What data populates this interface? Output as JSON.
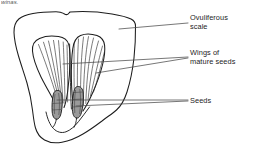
{
  "page": {
    "width": 253,
    "height": 160,
    "background_color": "#ffffff",
    "ink_color": "#1d1d1d",
    "seed_fill_color": "#8e8e8e"
  },
  "caption": {
    "fragment_text": "winas."
  },
  "labels": [
    {
      "id": "ovuliferous-scale",
      "text": "Ovuliferous\nscale",
      "leader_from": [
        188,
        23
      ],
      "leader_to": [
        119,
        29
      ]
    },
    {
      "id": "wings-of-mature-seeds",
      "text": "Wings of\nmature seeds",
      "leader_from": [
        188,
        57
      ],
      "leader_to": [
        63,
        64
      ]
    },
    {
      "id": "seeds",
      "text": "Seeds",
      "leader_from": [
        188,
        100
      ],
      "leader_to": [
        57,
        101
      ]
    }
  ],
  "diagram": {
    "name": "ovuliferous-scale-with-winged-seeds",
    "parts": [
      "ovuliferous scale outer outline",
      "left wing of mature seed",
      "right wing of mature seed",
      "left seed",
      "right seed",
      "wing striations"
    ]
  }
}
